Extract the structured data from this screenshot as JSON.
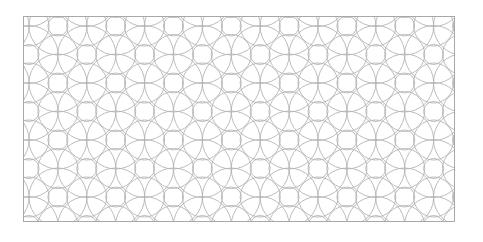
{
  "image": {
    "description": "Geometric overlapping-circles lattice pattern in light gray on white, enclosed in a rectangular border",
    "line_color": "#b4b4b4",
    "border_color": "#a8a8a8",
    "background_color": "#ffffff",
    "frame": {
      "left": 23,
      "top": 16,
      "width": 432,
      "height": 206
    },
    "lattice": {
      "dx": 28.9,
      "dy": 28.5,
      "origin_x": 28,
      "origin_y": 25
    },
    "radii": {
      "small": 10,
      "medium": 20,
      "large": 29
    }
  }
}
